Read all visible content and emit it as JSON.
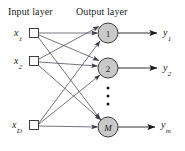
{
  "figure": {
    "type": "neural-network-diagram",
    "width": 185,
    "height": 151,
    "background_color": "#ffffff",
    "line_color": "#3a3a4a",
    "node_fill_color": "#c9c9c9",
    "node_stroke_color": "#2b2b2b",
    "square_fill_color": "#ffffff",
    "square_stroke_color": "#2b2b2b"
  },
  "titles": {
    "input_layer": "Input layer",
    "output_layer": "Output layer"
  },
  "input_layer": {
    "nodes": [
      {
        "id": "x1",
        "base": "x",
        "sub": "1",
        "cx": 34,
        "cy": 33,
        "size": 9
      },
      {
        "id": "x2",
        "base": "x",
        "sub": "2",
        "cx": 34,
        "cy": 61,
        "size": 9
      },
      {
        "id": "xD",
        "base": "x",
        "sub": "D",
        "cx": 34,
        "cy": 125,
        "size": 9
      }
    ]
  },
  "output_layer": {
    "nodes": [
      {
        "id": "o1",
        "label": "1",
        "italic": false,
        "cx": 108,
        "cy": 33,
        "r": 10
      },
      {
        "id": "o2",
        "label": "2",
        "italic": false,
        "cx": 108,
        "cy": 68,
        "r": 10
      },
      {
        "id": "oM",
        "label": "M",
        "italic": true,
        "cx": 108,
        "cy": 127,
        "r": 10
      }
    ],
    "vertical_ellipsis_dots": 3
  },
  "outputs": [
    {
      "id": "y1",
      "base": "y",
      "sub": "1",
      "from": "o1"
    },
    {
      "id": "y2",
      "base": "y",
      "sub": "2",
      "from": "o2"
    },
    {
      "id": "ym",
      "base": "y",
      "sub": "m",
      "from": "oM"
    }
  ],
  "connections": [
    {
      "from": "x1",
      "to": "o1"
    },
    {
      "from": "x1",
      "to": "o2"
    },
    {
      "from": "x1",
      "to": "oM"
    },
    {
      "from": "x2",
      "to": "o1"
    },
    {
      "from": "x2",
      "to": "o2"
    },
    {
      "from": "x2",
      "to": "oM"
    },
    {
      "from": "xD",
      "to": "o1"
    },
    {
      "from": "xD",
      "to": "o2"
    },
    {
      "from": "xD",
      "to": "oM"
    }
  ]
}
